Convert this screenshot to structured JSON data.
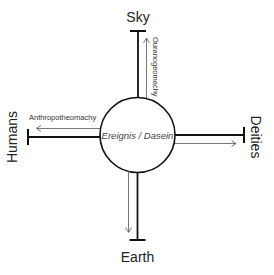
{
  "diagram": {
    "center": {
      "label": "Ereignis / Dasein"
    },
    "poles": {
      "top": {
        "label": "Sky"
      },
      "bottom": {
        "label": "Earth"
      },
      "left": {
        "label": "Humans"
      },
      "right": {
        "label": "Deities"
      }
    },
    "arrows": {
      "up": {
        "label": "Ouranogeomachy",
        "direction": "up"
      },
      "left": {
        "label": "Anthropotheomachy",
        "direction": "left"
      },
      "right": {
        "label": "",
        "direction": "right"
      },
      "down": {
        "label": "",
        "direction": "down"
      }
    },
    "colors": {
      "stroke": "#111111",
      "thin_arrow": "#555555",
      "text": "#222222",
      "background": "#ffffff"
    }
  }
}
